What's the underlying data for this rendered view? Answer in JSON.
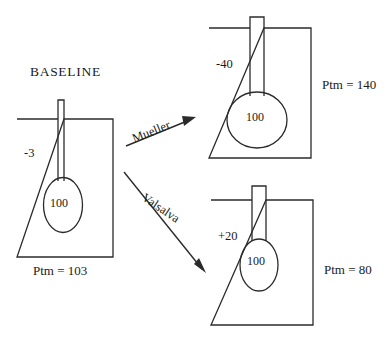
{
  "diagram": {
    "title_label": "BASELINE",
    "panels": [
      {
        "key": "baseline",
        "name": "baseline-panel",
        "pleural_pressure": "-3",
        "alveolar_pressure": "100",
        "transmural_label": "Ptm = 103"
      },
      {
        "key": "mueller",
        "name": "mueller-panel",
        "pleural_pressure": "-40",
        "alveolar_pressure": "100",
        "transmural_label": "Ptm = 140"
      },
      {
        "key": "valsalva",
        "name": "valsalva-panel",
        "pleural_pressure": "+20",
        "alveolar_pressure": "100",
        "transmural_label": "Ptm = 80"
      }
    ],
    "arrows": [
      {
        "key": "mueller",
        "label": "Mueller"
      },
      {
        "key": "valsalva",
        "label": "Valsalva"
      }
    ],
    "colors": {
      "stroke": "#2b2b2b",
      "text": "#1a1a1a",
      "background": "#ffffff"
    }
  }
}
